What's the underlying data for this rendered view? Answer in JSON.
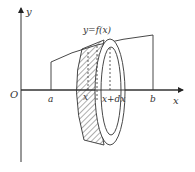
{
  "diagram": {
    "type": "solid-of-revolution-shell",
    "labels": {
      "y_axis": "y",
      "x_axis": "x",
      "origin": "O",
      "curve": "y=f(x)",
      "a": "a",
      "b": "b",
      "x": "x",
      "x_plus_dx": "x+dx"
    },
    "colors": {
      "stroke": "#333333",
      "background": "#ffffff"
    }
  }
}
